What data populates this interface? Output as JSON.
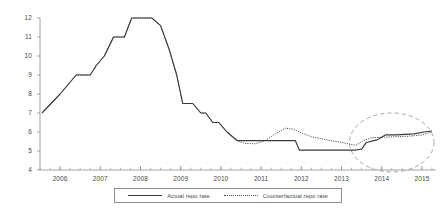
{
  "chart_data": {
    "type": "line",
    "title": "",
    "subtitle": "",
    "xlabel": "",
    "ylabel": "",
    "xlim": [
      2005.5,
      2015.35
    ],
    "ylim": [
      4,
      12
    ],
    "yticks": [
      4,
      5,
      6,
      7,
      8,
      9,
      10,
      11,
      12
    ],
    "ytick_labels": [
      "4",
      "5",
      "6",
      "7",
      "8",
      "9",
      "10",
      "11",
      "12"
    ],
    "xticks": [
      2006,
      2007,
      2008,
      2009,
      2010,
      2011,
      2012,
      2013,
      2014,
      2015
    ],
    "xtick_labels": [
      "2006",
      "2007",
      "2008",
      "2009",
      "2010",
      "2011",
      "2012",
      "2013",
      "2014",
      "2015"
    ],
    "x_minor_ticks_per_interval": 4,
    "grid": false,
    "legend_position": "below",
    "series": [
      {
        "name": "Actual repo rate",
        "style": "solid",
        "color": "#3b3b3b",
        "x": [
          2005.55,
          2006.0,
          2006.4,
          2006.5,
          2006.75,
          2006.9,
          2007.1,
          2007.33,
          2007.4,
          2007.6,
          2007.78,
          2008.1,
          2008.28,
          2008.5,
          2008.72,
          2008.9,
          2009.05,
          2009.3,
          2009.5,
          2009.62,
          2009.8,
          2009.95,
          2010.15,
          2010.4,
          2010.55,
          2011.85,
          2011.95,
          2013.35,
          2013.5,
          2013.62,
          2013.9,
          2014.1,
          2014.35,
          2014.8,
          2015.05,
          2015.25
        ],
        "y": [
          7.0,
          8.0,
          9.0,
          9.0,
          9.0,
          9.5,
          10.0,
          11.0,
          11.0,
          11.0,
          12.0,
          12.0,
          12.0,
          11.6,
          10.3,
          9.0,
          7.5,
          7.5,
          7.0,
          7.0,
          6.5,
          6.5,
          6.0,
          5.55,
          5.55,
          5.55,
          5.05,
          5.05,
          5.1,
          5.45,
          5.6,
          5.85,
          5.85,
          5.9,
          6.0,
          6.05
        ]
      },
      {
        "name": "Counterfactual repo rate",
        "style": "dotted",
        "color": "#4a4a4a",
        "x": [
          2005.55,
          2006.0,
          2006.4,
          2006.5,
          2006.75,
          2006.9,
          2007.1,
          2007.33,
          2007.4,
          2007.6,
          2007.78,
          2008.1,
          2008.28,
          2008.5,
          2008.72,
          2008.9,
          2009.05,
          2009.3,
          2009.5,
          2009.62,
          2009.8,
          2009.95,
          2010.15,
          2010.4,
          2010.6,
          2010.85,
          2011.1,
          2011.35,
          2011.6,
          2011.8,
          2012.0,
          2012.25,
          2012.6,
          2013.0,
          2013.35,
          2013.55,
          2013.75,
          2014.0,
          2014.3,
          2014.7,
          2015.0,
          2015.25
        ],
        "y": [
          7.0,
          8.0,
          9.0,
          9.0,
          9.0,
          9.5,
          10.0,
          11.0,
          11.0,
          11.0,
          12.0,
          12.0,
          12.0,
          11.6,
          10.3,
          9.0,
          7.5,
          7.5,
          7.0,
          7.0,
          6.5,
          6.5,
          6.0,
          5.55,
          5.4,
          5.38,
          5.55,
          5.9,
          6.2,
          6.15,
          5.95,
          5.75,
          5.6,
          5.45,
          5.3,
          5.55,
          5.7,
          5.72,
          5.75,
          5.78,
          5.85,
          6.0
        ]
      }
    ],
    "annotations": [
      {
        "type": "ellipse",
        "name": "highlight-ellipse",
        "style": "dashed",
        "center_x": 2014.25,
        "center_y": 5.45,
        "radius_x_years": 1.05,
        "radius_y_value": 1.55
      }
    ]
  }
}
